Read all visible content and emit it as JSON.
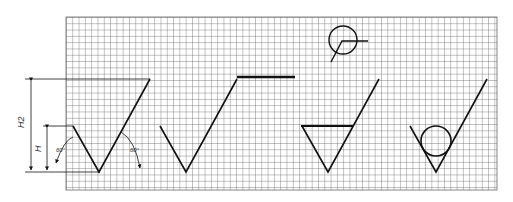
{
  "figure": {
    "labels": {
      "h2": "H2",
      "h": "H",
      "angle_left": "60°",
      "angle_right": "60°"
    },
    "grid": {
      "left": 66,
      "top": 17,
      "right": 497,
      "bottom": 190,
      "spacing": 6.3
    },
    "colors": {
      "grid": "#555555",
      "line": "#111111",
      "bg": "#ffffff"
    },
    "panels": [
      "V-groove with dimensions",
      "V-groove with flat bar",
      "V-groove with horizontal bar (triangle)",
      "V-groove with ball"
    ]
  }
}
